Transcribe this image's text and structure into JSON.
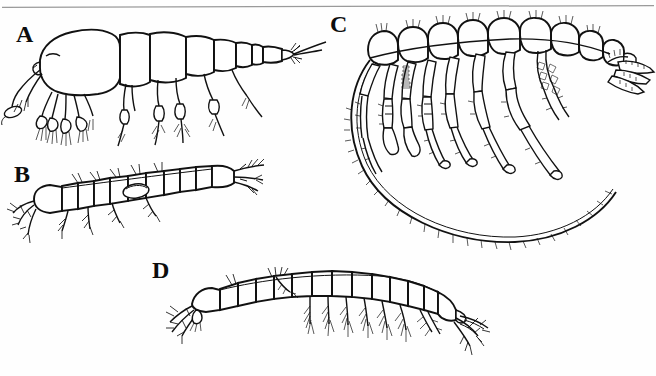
{
  "figure": {
    "background_color": "#fefefe",
    "ink_color": "#111111",
    "rule_color": "#9a9a9a",
    "width": 656,
    "height": 376,
    "top_rule": {
      "name": "horizontal-rule",
      "visible": true,
      "color": "#9a9a9a"
    },
    "panels": [
      {
        "id": "A",
        "label": "A",
        "label_x": 16,
        "label_y": 22,
        "subject": "lateral-view-crustacean-mysid-like",
        "description": "Lateral view of a shrimp-like crustacean with large carapace, segmented pleon, setose pereopods and long antenna"
      },
      {
        "id": "B",
        "label": "B",
        "label_x": 14,
        "label_y": 162,
        "subject": "dorsal-view-crustacean-elongate",
        "description": "Dorsal view of an elongate segmented crustacean with lateral setae and terminal uropods"
      },
      {
        "id": "C",
        "label": "C",
        "label_x": 330,
        "label_y": 12,
        "subject": "lateral-view-crustacean-with-carapace-fringe",
        "description": "Large lateral view of a crustacean with numerous elongate thoracic limbs and a long setose ventral carapace margin"
      },
      {
        "id": "D",
        "label": "D",
        "label_x": 155,
        "label_y": 260,
        "subject": "lateral-view-crustacean-amphipod-like",
        "description": "Lateral view of an arched segmented crustacean with slender setose pleopods and terminal uropods"
      }
    ]
  }
}
